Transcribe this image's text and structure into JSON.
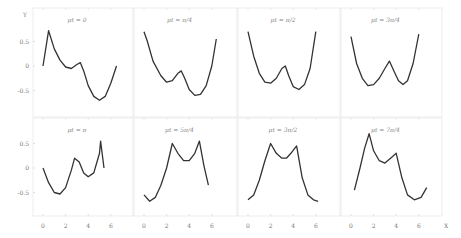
{
  "figure": {
    "x_axis_label": "X",
    "y_axis_label": "Y"
  },
  "chart_data": {
    "type": "line",
    "layout": "2x4 grid of subplots, shared axes",
    "xlabel": "X",
    "ylabel": "Y",
    "xticks": [
      "0",
      "2",
      "4",
      "6"
    ],
    "yticks_top_row": [
      "0.5",
      "0",
      "-0.5"
    ],
    "yticks_bottom_row": [
      "0.5",
      "0",
      "-0.5"
    ],
    "grid": false,
    "panels": [
      {
        "title": "μt = 0",
        "x": [
          0.0,
          0.5,
          1.0,
          1.5,
          2.0,
          2.5,
          3.0,
          3.3,
          3.6,
          4.0,
          4.5,
          5.0,
          5.5,
          6.0,
          6.5
        ],
        "y": [
          0.0,
          0.72,
          0.35,
          0.12,
          -0.02,
          -0.05,
          0.03,
          0.07,
          -0.1,
          -0.4,
          -0.62,
          -0.7,
          -0.62,
          -0.35,
          0.0
        ]
      },
      {
        "title": "μt = π/4",
        "x": [
          0.0,
          0.3,
          0.8,
          1.5,
          2.0,
          2.5,
          3.0,
          3.3,
          3.6,
          4.0,
          4.5,
          5.0,
          5.5,
          6.0,
          6.4
        ],
        "y": [
          0.7,
          0.5,
          0.1,
          -0.2,
          -0.33,
          -0.3,
          -0.15,
          -0.1,
          -0.25,
          -0.48,
          -0.6,
          -0.58,
          -0.4,
          0.0,
          0.55
        ]
      },
      {
        "title": "μt = π/2",
        "x": [
          0.0,
          0.5,
          1.0,
          1.5,
          2.0,
          2.5,
          3.0,
          3.3,
          3.6,
          4.0,
          4.5,
          5.0,
          5.5,
          6.0
        ],
        "y": [
          0.7,
          0.2,
          -0.15,
          -0.33,
          -0.35,
          -0.25,
          -0.05,
          0.0,
          -0.2,
          -0.42,
          -0.48,
          -0.38,
          -0.05,
          0.7
        ]
      },
      {
        "title": "μt = 3π/4",
        "x": [
          0.0,
          0.5,
          1.0,
          1.5,
          2.0,
          2.5,
          3.0,
          3.4,
          3.8,
          4.2,
          4.6,
          5.0,
          5.5,
          6.0
        ],
        "y": [
          0.6,
          0.05,
          -0.25,
          -0.4,
          -0.38,
          -0.25,
          -0.05,
          0.1,
          -0.1,
          -0.3,
          -0.38,
          -0.3,
          0.05,
          0.65
        ]
      },
      {
        "title": "μt = π",
        "x": [
          0.0,
          0.5,
          1.0,
          1.5,
          2.0,
          2.5,
          2.8,
          3.2,
          3.6,
          4.0,
          4.5,
          5.0,
          5.1,
          5.4
        ],
        "y": [
          0.0,
          -0.3,
          -0.5,
          -0.53,
          -0.4,
          -0.05,
          0.2,
          0.12,
          -0.1,
          -0.18,
          -0.1,
          0.3,
          0.55,
          0.0
        ]
      },
      {
        "title": "μt = 5π/4",
        "x": [
          0.0,
          0.5,
          1.0,
          1.5,
          2.0,
          2.5,
          3.0,
          3.5,
          4.0,
          4.5,
          4.9,
          5.3,
          5.7
        ],
        "y": [
          -0.55,
          -0.68,
          -0.6,
          -0.35,
          0.0,
          0.5,
          0.3,
          0.15,
          0.15,
          0.3,
          0.55,
          0.05,
          -0.35
        ]
      },
      {
        "title": "μt = 3π/2",
        "x": [
          0.0,
          0.5,
          1.0,
          1.5,
          2.0,
          2.5,
          3.0,
          3.4,
          3.8,
          4.3,
          4.8,
          5.3,
          5.8,
          6.2
        ],
        "y": [
          -0.65,
          -0.55,
          -0.25,
          0.15,
          0.5,
          0.3,
          0.2,
          0.2,
          0.3,
          0.45,
          -0.2,
          -0.55,
          -0.65,
          -0.68
        ]
      },
      {
        "title": "μt = 7π/4",
        "x": [
          0.3,
          0.8,
          1.2,
          1.6,
          2.0,
          2.5,
          3.0,
          3.5,
          4.0,
          4.5,
          5.0,
          5.6,
          6.2,
          6.7
        ],
        "y": [
          -0.45,
          0.0,
          0.4,
          0.7,
          0.35,
          0.15,
          0.1,
          0.2,
          0.3,
          -0.2,
          -0.55,
          -0.65,
          -0.6,
          -0.4
        ]
      }
    ]
  }
}
